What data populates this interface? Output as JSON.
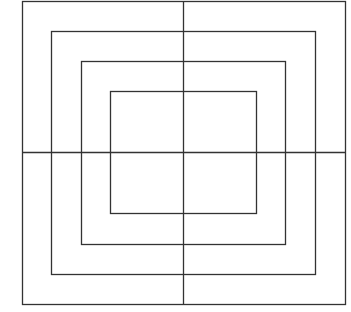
{
  "diagram": {
    "width": 351,
    "height": 312,
    "stroke_color": "#333333",
    "background": "#ffffff",
    "rectangles": [
      {
        "name": "outer",
        "x": 22,
        "y": 1,
        "w": 323,
        "h": 303
      },
      {
        "name": "second",
        "x": 51,
        "y": 31,
        "w": 264,
        "h": 243
      },
      {
        "name": "third",
        "x": 81,
        "y": 61,
        "w": 204,
        "h": 183
      },
      {
        "name": "inner",
        "x": 110,
        "y": 91,
        "w": 146,
        "h": 122
      }
    ],
    "cross": {
      "vertical": {
        "x": 183,
        "y1": 1,
        "y2": 304
      },
      "horizontal": {
        "y": 152,
        "x1": 22,
        "x2": 345
      }
    }
  }
}
